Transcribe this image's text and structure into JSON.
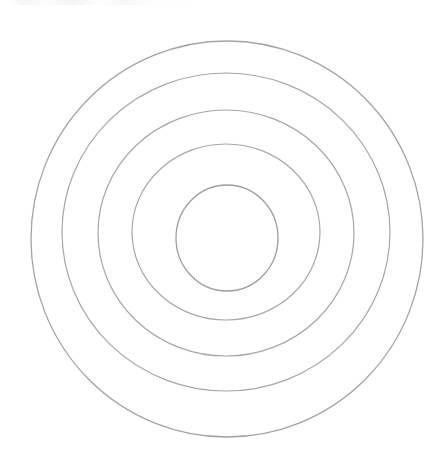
{
  "figure": {
    "background_color": "#ffffff",
    "width": 447,
    "height": 456
  },
  "chart_data": {
    "type": "scatter",
    "subtitle": "",
    "xlabel": "",
    "ylabel": "",
    "xlim": [
      0,
      447
    ],
    "ylim": [
      0,
      456
    ],
    "grid": false,
    "legend": false,
    "legend_position": "none",
    "tick_labels": [],
    "annotations": [],
    "render_style": "hand-drawn line art, unfilled circles",
    "shape": "concentric-circles",
    "count": 5,
    "center": {
      "x": 226,
      "y": 238
    },
    "stroke_color": "#9e9e9e",
    "stroke_width": 1.2,
    "fill": "none",
    "circles": [
      {
        "name": "ring-1-outer",
        "index": 1,
        "radius": 197,
        "cx": 227,
        "cy": 239,
        "stroke_color": "#a3a3a3",
        "stroke_width": 1.3
      },
      {
        "name": "ring-2",
        "index": 2,
        "radius": 163,
        "cx": 226,
        "cy": 232,
        "stroke_color": "#a6a6a6",
        "stroke_width": 1.2
      },
      {
        "name": "ring-3",
        "index": 3,
        "radius": 128,
        "cx": 226,
        "cy": 233,
        "stroke_color": "#a6a6a6",
        "stroke_width": 1.2
      },
      {
        "name": "ring-4",
        "index": 4,
        "radius": 94,
        "cx": 226,
        "cy": 232,
        "stroke_color": "#a8a8a8",
        "stroke_width": 1.2
      },
      {
        "name": "ring-5-innermost",
        "index": 5,
        "radius": 51,
        "cx": 227,
        "cy": 238,
        "stroke_color": "#9e9e9e",
        "stroke_width": 1.3
      }
    ],
    "radii": [
      197,
      163,
      128,
      94,
      51
    ],
    "gaps": [
      34,
      35,
      34,
      43
    ]
  },
  "artifact": {
    "top_strip_label": "faint-scan-artifact"
  }
}
